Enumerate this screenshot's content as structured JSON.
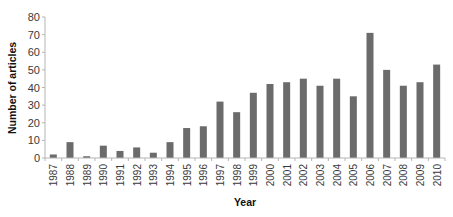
{
  "chart_data": {
    "type": "bar",
    "title": "",
    "xlabel": "Year",
    "ylabel": "Number of articles",
    "ylim": [
      0,
      80
    ],
    "yticks": [
      0,
      10,
      20,
      30,
      40,
      50,
      60,
      70,
      80
    ],
    "grid": false,
    "legend": null,
    "bar_color": "#6b6b6b",
    "categories": [
      "1987",
      "1988",
      "1989",
      "1990",
      "1991",
      "1992",
      "1993",
      "1994",
      "1995",
      "1996",
      "1997",
      "1998",
      "1999",
      "2000",
      "2001",
      "2002",
      "2003",
      "2004",
      "2005",
      "2006",
      "2007",
      "2008",
      "2009",
      "2010"
    ],
    "values": [
      2,
      9,
      1,
      7,
      4,
      6,
      3,
      9,
      17,
      18,
      32,
      26,
      37,
      42,
      43,
      45,
      41,
      45,
      35,
      71,
      50,
      41,
      43,
      53
    ]
  }
}
